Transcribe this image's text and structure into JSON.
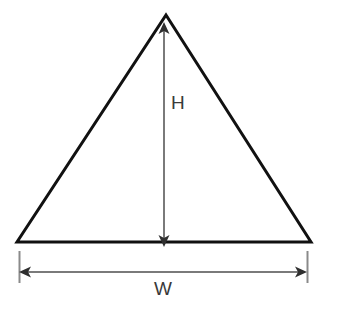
{
  "figure": {
    "type": "geometry-diagram",
    "background_color": "#ffffff"
  },
  "shape": {
    "name": "triangle",
    "stroke_color": "#111111",
    "stroke_width": 3,
    "fill": "none",
    "vertices": {
      "apex": {
        "x": 166,
        "y": 15
      },
      "bottom_left": {
        "x": 17,
        "y": 242
      },
      "bottom_right": {
        "x": 311,
        "y": 242
      }
    }
  },
  "dimensions": [
    {
      "id": "height",
      "label": "H",
      "orientation": "vertical",
      "arrow_color": "#7a7a7a",
      "arrow_width": 2,
      "arrowheads": "both",
      "from": {
        "x": 164,
        "y": 28
      },
      "to": {
        "x": 164,
        "y": 241
      },
      "label_position": {
        "x": 171,
        "y": 93
      }
    },
    {
      "id": "width",
      "label": "W",
      "orientation": "horizontal",
      "arrow_color": "#7a7a7a",
      "arrow_width": 2,
      "arrowheads": "both",
      "from": {
        "x": 22,
        "y": 272
      },
      "to": {
        "x": 304,
        "y": 272
      },
      "label_position": {
        "x": 154,
        "y": 279
      },
      "extension_lines": [
        {
          "x": 19,
          "y1": 250,
          "y2": 283
        },
        {
          "x": 307,
          "y1": 250,
          "y2": 283
        }
      ]
    }
  ],
  "labels": {
    "height_label": "H",
    "width_label": "W"
  },
  "colors": {
    "shape_stroke": "#111111",
    "dimension_line": "#7a7a7a",
    "label_text": "#3a3a3a",
    "background": "#ffffff"
  }
}
